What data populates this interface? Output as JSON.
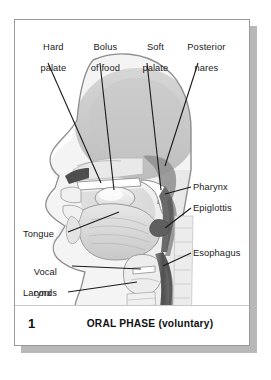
{
  "figure": {
    "caption_number": "1",
    "caption_title": "ORAL PHASE (voluntary)"
  },
  "labels": {
    "top": [
      {
        "id": "hard-palate",
        "line1": "Hard",
        "line2": "palate",
        "text": "Hard palate"
      },
      {
        "id": "bolus-of-food",
        "line1": "Bolus",
        "line2": "of food",
        "text": "Bolus of food"
      },
      {
        "id": "soft-palate",
        "line1": "Soft",
        "line2": "palate",
        "text": "Soft palate"
      },
      {
        "id": "posterior-nares",
        "line1": "Posterior",
        "line2": "nares",
        "text": "Posterior nares"
      }
    ],
    "right": [
      {
        "id": "pharynx",
        "text": "Pharynx"
      },
      {
        "id": "epiglottis",
        "text": "Epiglottis"
      },
      {
        "id": "esophagus",
        "text": "Esophagus"
      }
    ],
    "left": [
      {
        "id": "tongue",
        "line1": "Tongue",
        "line2": "",
        "text": "Tongue"
      },
      {
        "id": "vocal-cords",
        "line1": "Vocal",
        "line2": "cords",
        "text": "Vocal cords"
      },
      {
        "id": "larynx",
        "line1": "Larynx",
        "line2": "",
        "text": "Larynx"
      }
    ]
  },
  "colors": {
    "page_background": "#ffffff",
    "frame_border": "#9a9a9a",
    "frame_shadow": "#b8b8b8",
    "leader_line": "#1a1a1a",
    "text": "#1a1a1a",
    "skin_outline": "#8d8d8d",
    "skin_fill": "#f2f2f2",
    "cranium_fill": "#cfcfcf",
    "nasal_cavity": "#e3e3e3",
    "soft_palate": "#ffffff",
    "tongue_fill": "#dcdcdc",
    "bolus_fill": "#ededed",
    "pharynx_dark": "#636363",
    "esophagus_dark": "#5a5a5a",
    "vertebrae_fill": "#e8e8e8",
    "mouth_cavity_dark": "#4a4a4a"
  }
}
